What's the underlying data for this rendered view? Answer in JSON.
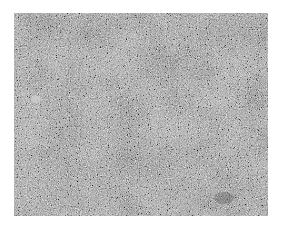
{
  "image": {
    "description": "Grayscale granular noise texture photograph",
    "colors": {
      "background": "#ffffff",
      "base_gray": "#8a8a8a",
      "dark_speckle": "#3a3a3a",
      "light_speckle": "#d8d8d8"
    },
    "frame": {
      "x": 14,
      "y": 13,
      "width": 254,
      "height": 203
    }
  }
}
